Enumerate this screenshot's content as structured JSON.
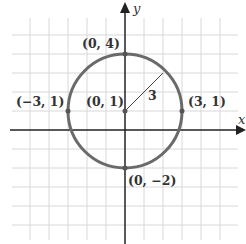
{
  "diagram": {
    "type": "circle-on-coordinate-plane",
    "axes": {
      "x_label": "x",
      "y_label": "y"
    },
    "grid": {
      "x_range": [
        -5,
        5
      ],
      "y_range": [
        -5,
        5
      ],
      "unit_px": 19,
      "origin_px": [
        125,
        130
      ]
    },
    "circle": {
      "center": [
        0,
        1
      ],
      "radius": 3
    },
    "radius_label": "3",
    "points": [
      {
        "label": "(0, 4)",
        "x": 0,
        "y": 4
      },
      {
        "label": "(−3, 1)",
        "x": -3,
        "y": 1
      },
      {
        "label": "(0, 1)",
        "x": 0,
        "y": 1
      },
      {
        "label": "(3, 1)",
        "x": 3,
        "y": 1
      },
      {
        "label": "(0, −2)",
        "x": 0,
        "y": -2
      }
    ],
    "colors": {
      "grid": "#d8d8d8",
      "axis": "#222222",
      "circle": "#6a6a6a",
      "text": "#333333"
    }
  }
}
